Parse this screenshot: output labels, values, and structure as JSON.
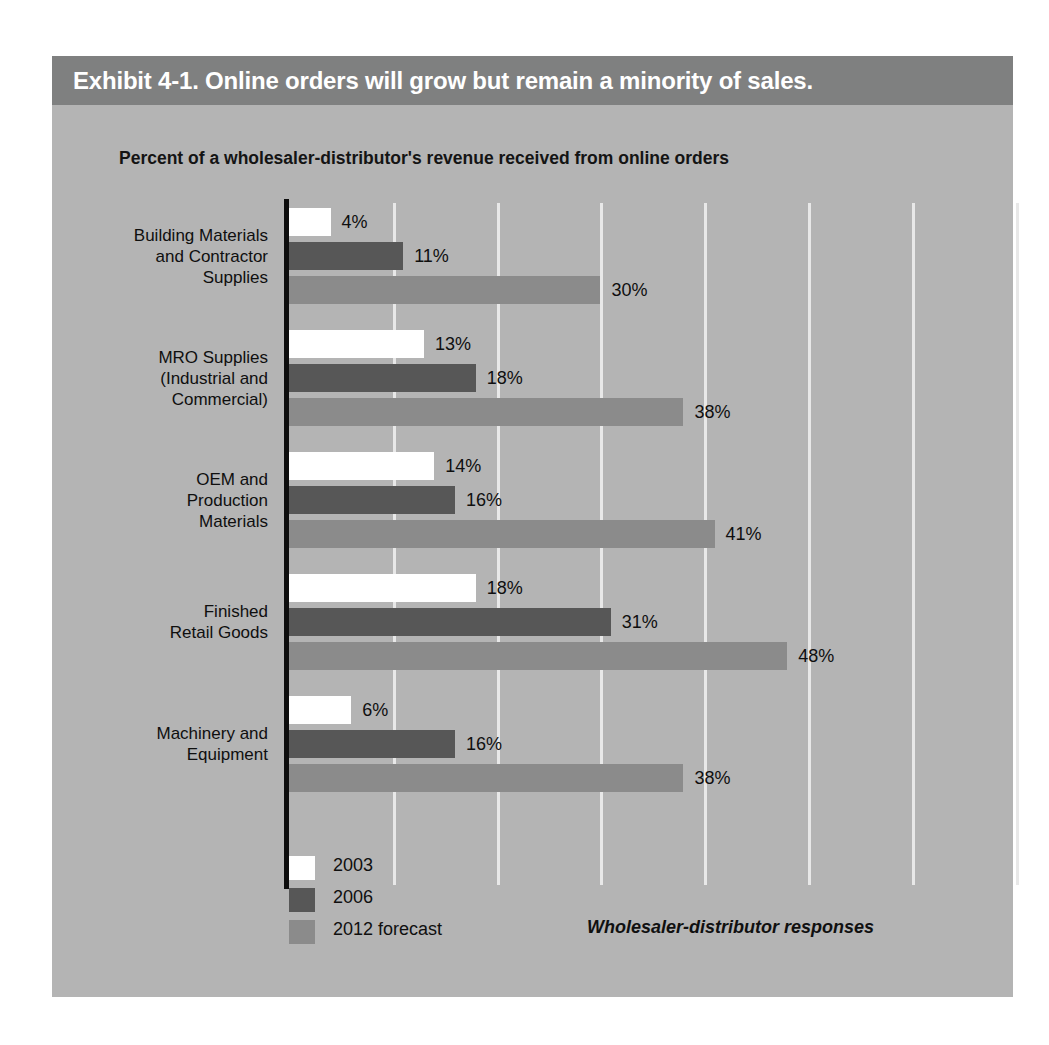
{
  "exhibit": {
    "header_title": "Exhibit 4-1. Online orders will grow but remain a minority of sales.",
    "subtitle": "Percent of a wholesaler-distributor's revenue received from online orders",
    "source_note": "Wholesaler-distributor responses"
  },
  "colors": {
    "page_background": "#ffffff",
    "panel_background": "#b4b4b4",
    "header_band": "#7f8080",
    "header_text": "#ffffff",
    "gridline": "#e8e8e8",
    "axis": "#0d0d0d",
    "series_2003": "#ffffff",
    "series_2006": "#575757",
    "series_2012": "#8b8b8b",
    "text": "#0f0f0f"
  },
  "legend": {
    "items": [
      {
        "label": "2003",
        "color": "#ffffff"
      },
      {
        "label": "2006",
        "color": "#575757"
      },
      {
        "label": "2012 forecast",
        "color": "#8b8b8b"
      }
    ]
  },
  "chart_data": {
    "type": "bar",
    "orientation": "horizontal",
    "title": "Exhibit 4-1. Online orders will grow but remain a minority of sales.",
    "subtitle": "Percent of a wholesaler-distributor's revenue received from online orders",
    "xlabel": "",
    "ylabel": "",
    "xlim": [
      0,
      70
    ],
    "grid": true,
    "gridline_values": [
      10,
      20,
      30,
      40,
      50,
      60,
      70
    ],
    "axis_tick_labels_shown": false,
    "value_label_suffix": "%",
    "legend_position": "bottom-left",
    "annotation": "Wholesaler-distributor responses",
    "categories": [
      "Building Materials and Contractor Supplies",
      "MRO Supplies (Industrial and Commercial)",
      "OEM and Production Materials",
      "Finished Retail Goods",
      "Machinery and Equipment"
    ],
    "category_lines": [
      [
        "Building Materials",
        "and Contractor",
        "Supplies"
      ],
      [
        "MRO Supplies",
        "(Industrial and",
        "Commercial)"
      ],
      [
        "OEM and",
        "Production",
        "Materials"
      ],
      [
        "Finished",
        "Retail Goods"
      ],
      [
        "Machinery and",
        "Equipment"
      ]
    ],
    "series": [
      {
        "name": "2003",
        "color": "#ffffff",
        "values": [
          4,
          13,
          14,
          18,
          6
        ]
      },
      {
        "name": "2006",
        "color": "#575757",
        "values": [
          11,
          18,
          16,
          31,
          16
        ]
      },
      {
        "name": "2012 forecast",
        "color": "#8b8b8b",
        "values": [
          30,
          38,
          41,
          48,
          38
        ]
      }
    ],
    "value_labels": [
      [
        "4%",
        "11%",
        "30%"
      ],
      [
        "13%",
        "18%",
        "38%"
      ],
      [
        "14%",
        "16%",
        "41%"
      ],
      [
        "18%",
        "31%",
        "48%"
      ],
      [
        "6%",
        "16%",
        "38%"
      ]
    ]
  }
}
